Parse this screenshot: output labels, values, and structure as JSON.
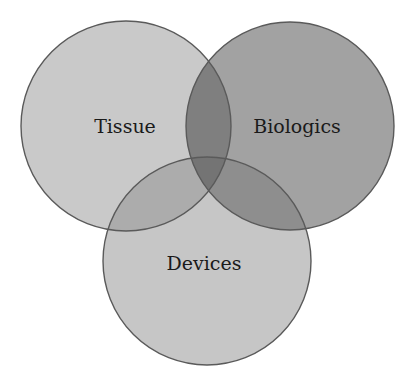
{
  "diagram": {
    "type": "venn",
    "sets": [
      {
        "id": "tissue",
        "label": "Tissue",
        "cx": 126,
        "cy": 126,
        "r": 105,
        "fill": "#c9c9c9"
      },
      {
        "id": "biologics",
        "label": "Biologics",
        "cx": 290,
        "cy": 126,
        "r": 104,
        "fill": "#a2a2a2"
      },
      {
        "id": "devices",
        "label": "Devices",
        "cx": 207,
        "cy": 261,
        "r": 104,
        "fill": "#c6c6c6"
      }
    ],
    "regions": {
      "tissue_biologics": "#7f7f7f",
      "tissue_devices": "#acacac",
      "biologics_devices": "#8e8e8e",
      "all_three": "#747474"
    },
    "outline_color": "#5a5a5a",
    "background": "#ffffff"
  }
}
